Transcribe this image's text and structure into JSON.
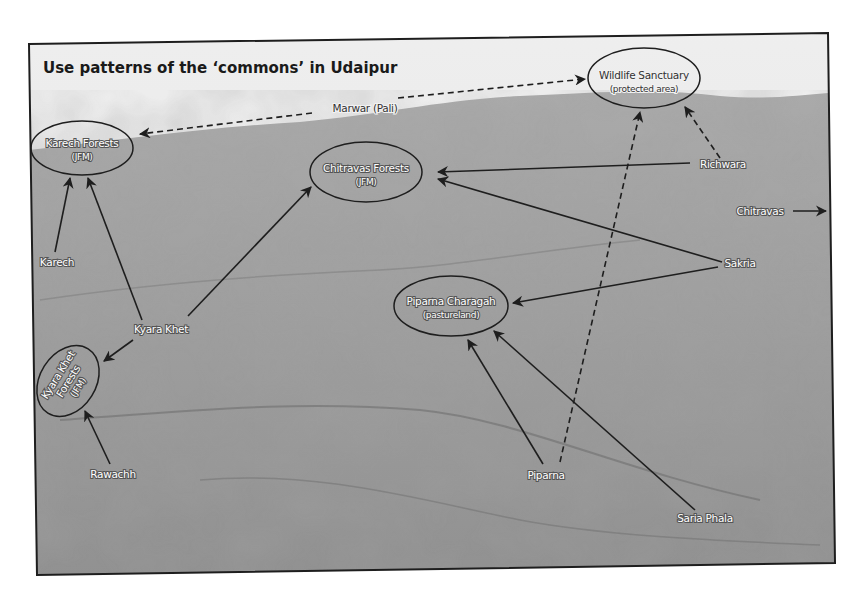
{
  "diagram": {
    "title": "Use patterns of the ‘commons’ in Udaipur",
    "background": "grayscale aerial photograph of forested hillside with terraces",
    "colors": {
      "frame": "#1e1e1e",
      "sky": "#ececec",
      "hill": "#9a9a9a",
      "arrow": "#1e1e1e",
      "label_fill": "#ffffff"
    },
    "resource_areas": [
      {
        "id": "karech_forests",
        "name": "Karech Forests",
        "type": "(JFM)"
      },
      {
        "id": "chitravas_forests",
        "name": "Chitravas Forests",
        "type": "(JFM)"
      },
      {
        "id": "wildlife_sanctuary",
        "name": "Wildlife Sanctuary",
        "type": "(protected area)"
      },
      {
        "id": "piparna_charagah",
        "name": "Piparna Charagah",
        "type": "(pastureland)"
      },
      {
        "id": "kyara_khet_forests",
        "name": "Kyara Khet Forests",
        "line1": "Kyara Khet",
        "line2": "Forests",
        "type": "(JFM)"
      }
    ],
    "villages": [
      {
        "id": "marwar",
        "name": "Marwar (Pali)"
      },
      {
        "id": "karech",
        "name": "Karech"
      },
      {
        "id": "kyara_khet",
        "name": "Kyara Khet"
      },
      {
        "id": "rawachh",
        "name": "Rawachh"
      },
      {
        "id": "richwara",
        "name": "Richwara"
      },
      {
        "id": "chitravas",
        "name": "Chitravas"
      },
      {
        "id": "sakria",
        "name": "Sakria"
      },
      {
        "id": "piparna",
        "name": "Piparna"
      },
      {
        "id": "saria_phala",
        "name": "Saria Phala"
      }
    ],
    "links": [
      {
        "from": "Marwar (Pali)",
        "to": "Karech Forests",
        "style": "dashed"
      },
      {
        "from": "Marwar (Pali)",
        "to": "Wildlife Sanctuary",
        "style": "dashed"
      },
      {
        "from": "Karech",
        "to": "Karech Forests",
        "style": "solid"
      },
      {
        "from": "Kyara Khet",
        "to": "Karech Forests",
        "style": "solid"
      },
      {
        "from": "Kyara Khet",
        "to": "Chitravas Forests",
        "style": "solid"
      },
      {
        "from": "Kyara Khet",
        "to": "Kyara Khet Forests",
        "style": "solid"
      },
      {
        "from": "Rawachh",
        "to": "Kyara Khet Forests",
        "style": "solid"
      },
      {
        "from": "Richwara",
        "to": "Chitravas Forests",
        "style": "solid"
      },
      {
        "from": "Richwara",
        "to": "Wildlife Sanctuary",
        "style": "dashed"
      },
      {
        "from": "Chitravas",
        "to": "outside frame (east)",
        "style": "solid"
      },
      {
        "from": "Sakria",
        "to": "Chitravas Forests",
        "style": "solid"
      },
      {
        "from": "Sakria",
        "to": "Piparna Charagah",
        "style": "solid"
      },
      {
        "from": "Piparna",
        "to": "Piparna Charagah",
        "style": "solid"
      },
      {
        "from": "Piparna",
        "to": "Wildlife Sanctuary",
        "style": "dashed"
      },
      {
        "from": "Saria Phala",
        "to": "Piparna Charagah",
        "style": "solid"
      }
    ],
    "legend": {
      "solid_arrow": "use of commons",
      "dashed_arrow": "use of commons (dashed)"
    }
  }
}
